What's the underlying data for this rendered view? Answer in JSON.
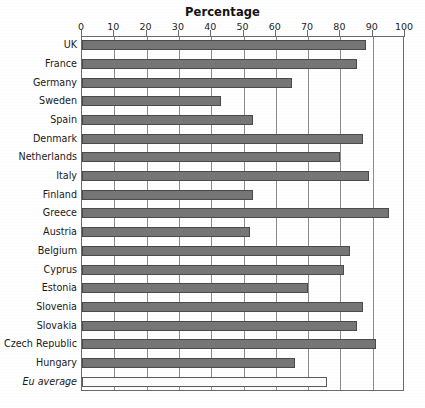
{
  "chart_data": {
    "type": "bar",
    "orientation": "horizontal",
    "title": "Percentage",
    "xlabel": "",
    "ylabel": "",
    "xlim": [
      0,
      100
    ],
    "xticks": [
      0,
      10,
      20,
      30,
      40,
      50,
      60,
      70,
      80,
      90,
      100
    ],
    "xtick_labels": [
      "0",
      "10",
      "20",
      "30",
      "40",
      "50",
      "60",
      "70",
      "80",
      "90",
      "100"
    ],
    "grid": true,
    "legend": "none",
    "bar_color": "#767676",
    "bar_edge_color": "#4a4a4a",
    "average_bar_color": "#fdfdfd",
    "categories": [
      "UK",
      "France",
      "Germany",
      "Sweden",
      "Spain",
      "Denmark",
      "Netherlands",
      "Italy",
      "Finland",
      "Greece",
      "Austria",
      "Belgium",
      "Cyprus",
      "Estonia",
      "Slovenia",
      "Slovakia",
      "Czech Republic",
      "Hungary",
      "Eu average"
    ],
    "values": [
      88,
      85,
      65,
      43,
      53,
      87,
      80,
      89,
      53,
      95,
      52,
      83,
      81,
      70,
      87,
      85,
      91,
      66,
      76
    ],
    "series": [
      {
        "name": "Percentage",
        "values": [
          88,
          85,
          65,
          43,
          53,
          87,
          80,
          89,
          53,
          95,
          52,
          83,
          81,
          70,
          87,
          85,
          91,
          66,
          76
        ]
      }
    ],
    "highlight_category": "Eu average",
    "highlight_style": "open-bar-italic-label"
  }
}
